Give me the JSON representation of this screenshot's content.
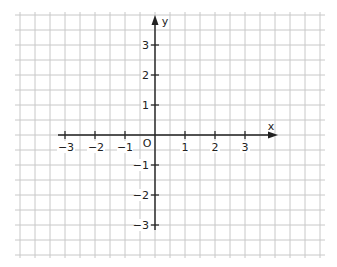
{
  "diagram": {
    "type": "coordinate-plane",
    "axes": {
      "x_label": "x",
      "y_label": "y",
      "origin_label": "O"
    },
    "x_ticks": [
      "−3",
      "−2",
      "−1",
      "1",
      "2",
      "3"
    ],
    "y_ticks": [
      "3",
      "2",
      "1",
      "−1",
      "−2",
      "−3"
    ],
    "colors": {
      "grid": "#c8c8c8",
      "axis": "#222222",
      "text": "#222222"
    }
  }
}
